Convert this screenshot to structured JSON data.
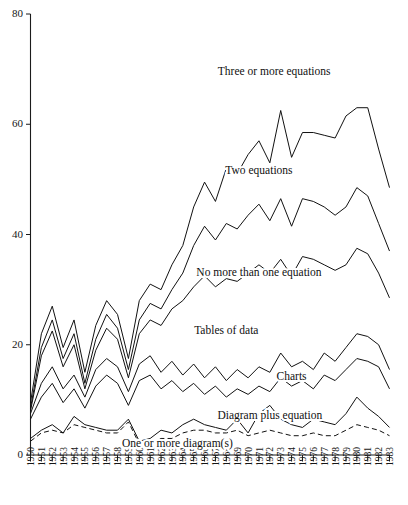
{
  "chart_data": {
    "type": "line",
    "title": "",
    "subtitle": "",
    "xlabel": "",
    "ylabel": "",
    "xlim": [
      1950,
      1983
    ],
    "ylim": [
      0,
      80
    ],
    "yticks": [
      0,
      20,
      40,
      60,
      80
    ],
    "grid": false,
    "legend_position": "inline-annotations",
    "x": [
      1950,
      1951,
      1952,
      1953,
      1954,
      1955,
      1956,
      1957,
      1958,
      1959,
      1960,
      1961,
      1962,
      1963,
      1964,
      1965,
      1966,
      1967,
      1968,
      1969,
      1970,
      1971,
      1972,
      1973,
      1974,
      1975,
      1976,
      1977,
      1978,
      1979,
      1980,
      1981,
      1982,
      1983
    ],
    "xtick_labels": [
      "1950",
      "1951",
      "1952",
      "1953",
      "1954",
      "1955",
      "1956",
      "1957",
      "1958",
      "1959",
      "1960",
      "1961",
      "1962",
      "1963",
      "1964",
      "1965",
      "1966",
      "1967",
      "1968",
      "1969",
      "1970",
      "1971",
      "1972",
      "1973",
      "1974",
      "1975",
      "1976",
      "1977",
      "1978",
      "1979",
      "1980",
      "1981",
      "1982",
      "1983"
    ],
    "series": [
      {
        "name": "Three or more equations",
        "label": "Three or more equations",
        "style": "solid",
        "label_x": 1972.4,
        "label_y": 69.5,
        "values": [
          9.5,
          22.0,
          27.0,
          19.5,
          24.5,
          15.0,
          23.5,
          28.0,
          25.5,
          17.5,
          28.0,
          31.0,
          30.0,
          34.5,
          38.0,
          45.0,
          49.5,
          46.0,
          52.0,
          51.0,
          54.5,
          57.0,
          53.0,
          62.5,
          54.0,
          58.5,
          58.5,
          58.0,
          57.5,
          61.5,
          63.0,
          63.0,
          55.5,
          48.5
        ]
      },
      {
        "name": "Two equations",
        "label": "Two equations",
        "style": "solid",
        "label_x": 1971.0,
        "label_y": 51.5,
        "values": [
          8.5,
          19.5,
          24.5,
          17.5,
          22.0,
          13.0,
          21.0,
          25.5,
          23.0,
          15.5,
          24.5,
          27.5,
          26.5,
          30.0,
          33.0,
          38.0,
          41.5,
          39.0,
          42.0,
          41.0,
          43.5,
          45.5,
          42.5,
          46.5,
          41.5,
          46.5,
          46.0,
          45.0,
          43.5,
          45.0,
          48.5,
          47.0,
          42.0,
          37.0
        ]
      },
      {
        "name": "No more than one equation",
        "label": "No more than one equation",
        "style": "solid",
        "label_x": 1971.0,
        "label_y": 33.0,
        "values": [
          8.0,
          18.0,
          22.5,
          16.0,
          20.0,
          12.0,
          19.0,
          23.0,
          21.0,
          14.0,
          22.0,
          24.5,
          23.5,
          26.5,
          28.0,
          30.5,
          32.5,
          30.5,
          32.0,
          31.5,
          33.0,
          34.5,
          33.0,
          35.5,
          32.5,
          36.0,
          35.5,
          34.5,
          33.5,
          34.5,
          37.5,
          36.5,
          33.0,
          28.5
        ]
      },
      {
        "name": "Tables of data",
        "label": "Tables of data",
        "style": "solid",
        "label_x": 1968.0,
        "label_y": 22.5,
        "values": [
          7.5,
          13.0,
          16.0,
          12.0,
          14.5,
          10.5,
          15.5,
          17.5,
          16.0,
          11.5,
          16.5,
          18.0,
          15.0,
          17.0,
          14.5,
          16.5,
          14.0,
          16.0,
          13.5,
          15.5,
          14.0,
          16.0,
          15.0,
          18.5,
          16.0,
          17.0,
          15.5,
          18.5,
          17.0,
          19.5,
          22.0,
          21.5,
          20.0,
          15.5
        ]
      },
      {
        "name": "Charts",
        "label": "Charts",
        "style": "solid",
        "label_x": 1974.0,
        "label_y": 14.0,
        "values": [
          6.5,
          10.5,
          13.0,
          9.5,
          12.0,
          8.5,
          12.5,
          14.5,
          13.0,
          9.0,
          13.5,
          14.5,
          12.0,
          13.5,
          11.5,
          13.0,
          11.0,
          12.5,
          10.5,
          12.0,
          11.0,
          12.5,
          11.5,
          14.0,
          12.5,
          13.5,
          12.0,
          14.5,
          13.5,
          15.5,
          17.5,
          17.0,
          16.0,
          12.0
        ]
      },
      {
        "name": "Diagram plus equation",
        "label": "Diagram plus equation",
        "style": "solid",
        "label_x": 1972.0,
        "label_y": 7.0,
        "values": [
          3.0,
          4.5,
          5.5,
          4.0,
          7.0,
          5.5,
          5.0,
          4.5,
          4.5,
          6.5,
          2.5,
          3.0,
          4.5,
          4.0,
          5.5,
          6.5,
          5.5,
          5.0,
          4.5,
          6.5,
          4.0,
          7.5,
          9.0,
          6.5,
          5.5,
          5.0,
          6.5,
          6.0,
          5.5,
          7.5,
          10.5,
          8.5,
          7.0,
          5.0
        ]
      },
      {
        "name": "One or more diagram(s)",
        "label": "One or more diagram(s)",
        "style": "dashed",
        "label_x": 1963.5,
        "label_y": 2.0,
        "values": [
          2.5,
          4.0,
          4.5,
          4.0,
          5.5,
          5.0,
          4.5,
          4.0,
          4.0,
          6.0,
          2.0,
          2.0,
          3.0,
          3.0,
          4.0,
          4.5,
          4.5,
          4.0,
          4.0,
          4.5,
          3.5,
          4.0,
          4.5,
          4.0,
          3.5,
          3.5,
          4.0,
          3.5,
          3.5,
          4.5,
          5.5,
          5.0,
          4.5,
          3.5
        ]
      }
    ]
  }
}
